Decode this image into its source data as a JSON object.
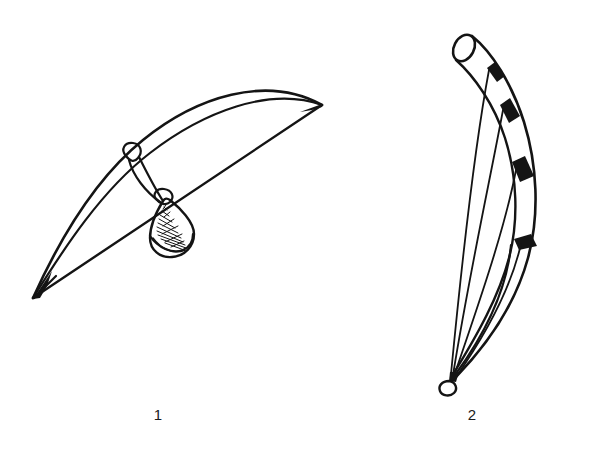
{
  "page": {
    "type": "line-art-illustration-plate",
    "background_color": "#ffffff",
    "ink_color": "#141414",
    "width": 589,
    "height": 449
  },
  "figures": [
    {
      "number": "1",
      "caption": "1",
      "subject": "musical-bow-with-gourd-resonator",
      "description": "Hunting-bow shaped instrument: a long slender curved stave spanning from a lower-left point to an upper-right point, a straight string stretched between the two tips, a small tie loop knotted on the stave, and a shaded conical gourd resonator hanging where the stave and string cross.",
      "parts": [
        "bow-stave",
        "bow-string",
        "tie-loop",
        "gourd-resonator",
        "resonator-hatching",
        "left-tip",
        "right-tip"
      ]
    },
    {
      "number": "2",
      "caption": "2",
      "subject": "curved-arched-harp-bow",
      "description": "Tall curved tubular body running from an open elliptical tube mouth at the top, bending down and right then sweeping back to a small ring at the bottom point; four strings run from dark binding bands on the body down to the bottom ring.",
      "parts": [
        "tube-mouth-ellipse",
        "curved-body",
        "binding-band-1",
        "binding-band-2",
        "binding-band-3",
        "binding-band-4",
        "string-1",
        "string-2",
        "string-3",
        "string-4",
        "bottom-ring"
      ],
      "string_count": 4,
      "band_count": 4
    }
  ],
  "captions": {
    "figure_one": "1",
    "figure_two": "2"
  }
}
